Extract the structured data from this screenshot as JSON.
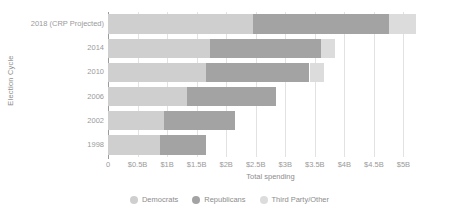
{
  "chart_data": {
    "type": "bar",
    "orientation": "horizontal",
    "stacked": true,
    "title": "",
    "xlabel": "Total spending",
    "ylabel": "Election Cycle",
    "categories": [
      "2018 (CRP Projected)",
      "2014",
      "2010",
      "2006",
      "2002",
      "1998"
    ],
    "xlim": [
      0,
      5.5
    ],
    "xticks": [
      0,
      0.5,
      1,
      1.5,
      2,
      2.5,
      3,
      3.5,
      4,
      4.5,
      5
    ],
    "xtick_labels": [
      "0",
      "$0.5B",
      "$1B",
      "$1.5B",
      "$2B",
      "$2.5B",
      "$3B",
      "$3.5B",
      "$4B",
      "$4.5B",
      "$5B"
    ],
    "grid": true,
    "legend_position": "bottom",
    "units": "billions of USD",
    "series": [
      {
        "name": "Democrats",
        "color": "#cfcfcf",
        "values": [
          2.45,
          1.72,
          1.66,
          1.34,
          0.95,
          0.88
        ]
      },
      {
        "name": "Republicans",
        "color": "#a3a3a3",
        "values": [
          2.31,
          1.89,
          1.75,
          1.51,
          1.2,
          0.77
        ]
      },
      {
        "name": "Third Party/Other",
        "color": "#dcdcdc",
        "values": [
          0.45,
          0.23,
          0.25,
          0.0,
          0.0,
          0.0
        ]
      }
    ],
    "totals": [
      5.21,
      3.84,
      3.66,
      2.85,
      2.15,
      1.65
    ]
  },
  "legend": {
    "items": [
      {
        "label": "Democrats",
        "color": "#cfcfcf"
      },
      {
        "label": "Republicans",
        "color": "#a3a3a3"
      },
      {
        "label": "Third Party/Other",
        "color": "#dcdcdc"
      }
    ]
  },
  "axes": {
    "x_title": "Total spending",
    "y_title": "Election Cycle"
  },
  "colors": {
    "gridline": "#e2e2e2",
    "axis": "#9b9b9b",
    "tick_text": "#9a9a9a",
    "title_text": "#8d8d8d",
    "background": "#ffffff"
  }
}
